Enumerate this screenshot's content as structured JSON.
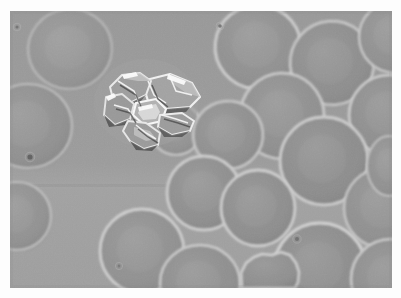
{
  "image": {
    "kind": "light-microscopy-micrograph",
    "modality": "phase-contrast",
    "subject": "red blood cells with crystal aggregate",
    "alt_text": "Phase-contrast micrograph of a blood smear showing numerous round erythrocytes on a uniform gray field with one large bright refractile polyhedral crystal aggregate in the upper left quadrant",
    "border": {
      "margin_color": "#ffffff",
      "left_px": 10,
      "top_px": 11,
      "width_px": 382,
      "height_px": 277
    },
    "palette": {
      "background_gray": "#9b9b9b",
      "background_gray_lower": "#9f9f9f",
      "cell_interior": "#8e8e8e",
      "cell_interior_dark": "#898989",
      "cell_rim_bright": "#c8c8c8",
      "cell_rim_soft": "#b4b4b4",
      "cell_shadow": "#7e7e7e",
      "crystal_highlight": "#f2f2f2",
      "crystal_midtone": "#a8a8a8",
      "crystal_shadow": "#434343",
      "artifact_dot": "#5a5a5a",
      "seam_line": "#949494"
    },
    "seam": {
      "present": true,
      "y_px": 175,
      "description": "faint horizontal tonal seam across full width"
    },
    "noise": {
      "grain_opacity": 0.16,
      "description": "fine film grain over the whole frame"
    },
    "cells": [
      {
        "name": "cell-top-left",
        "cx": 60,
        "cy": 38,
        "rx": 42,
        "ry": 40,
        "rot": -8,
        "tone": "#929292",
        "rim": "#b8b8b8",
        "rim_w": 2.2
      },
      {
        "name": "cell-top-mid-right",
        "cx": 248,
        "cy": 36,
        "rx": 43,
        "ry": 42,
        "rot": 6,
        "tone": "#8f8f8f",
        "rim": "#cfcfcf",
        "rim_w": 2.8
      },
      {
        "name": "cell-top-right",
        "cx": 322,
        "cy": 52,
        "rx": 42,
        "ry": 42,
        "rot": -4,
        "tone": "#8c8c8c",
        "rim": "#c9c9c9",
        "rim_w": 2.6
      },
      {
        "name": "cell-top-far-right",
        "cx": 385,
        "cy": 26,
        "rx": 36,
        "ry": 36,
        "rot": 0,
        "tone": "#8f8f8f",
        "rim": "#c6c6c6",
        "rim_w": 2.4
      },
      {
        "name": "cell-right-upper",
        "cx": 379,
        "cy": 104,
        "rx": 40,
        "ry": 40,
        "rot": 0,
        "tone": "#8d8d8d",
        "rim": "#cacaca",
        "rim_w": 2.6
      },
      {
        "name": "cell-mid-right-a",
        "cx": 272,
        "cy": 105,
        "rx": 42,
        "ry": 43,
        "rot": 10,
        "tone": "#8e8e8e",
        "rim": "#cbcbcb",
        "rim_w": 2.7
      },
      {
        "name": "cell-left-edge",
        "cx": 18,
        "cy": 115,
        "rx": 44,
        "ry": 42,
        "rot": 0,
        "tone": "#8f8f8f",
        "rim": "#bcbcbc",
        "rim_w": 2.2
      },
      {
        "name": "cell-crystal-adjacent",
        "cx": 166,
        "cy": 118,
        "rx": 26,
        "ry": 26,
        "rot": 0,
        "tone": "#919191",
        "rim": "#c4c4c4",
        "rim_w": 2.2
      },
      {
        "name": "cell-center-a",
        "cx": 218,
        "cy": 124,
        "rx": 35,
        "ry": 34,
        "rot": -6,
        "tone": "#8e8e8e",
        "rim": "#c8c8c8",
        "rim_w": 2.5
      },
      {
        "name": "cell-mid-right-b",
        "cx": 314,
        "cy": 150,
        "rx": 44,
        "ry": 44,
        "rot": 0,
        "tone": "#8b8b8b",
        "rim": "#cbcbcb",
        "rim_w": 2.8
      },
      {
        "name": "cell-center-b",
        "cx": 194,
        "cy": 182,
        "rx": 37,
        "ry": 37,
        "rot": 0,
        "tone": "#8d8d8d",
        "rim": "#cccccc",
        "rim_w": 2.8
      },
      {
        "name": "cell-center-c",
        "cx": 248,
        "cy": 197,
        "rx": 37,
        "ry": 38,
        "rot": 0,
        "tone": "#8c8c8c",
        "rim": "#cdcdcd",
        "rim_w": 2.8
      },
      {
        "name": "cell-left-low",
        "cx": 7,
        "cy": 205,
        "rx": 34,
        "ry": 34,
        "rot": 0,
        "tone": "#909090",
        "rim": "#bebebe",
        "rim_w": 2.2
      },
      {
        "name": "cell-right-low",
        "cx": 374,
        "cy": 197,
        "rx": 40,
        "ry": 40,
        "rot": 0,
        "tone": "#8e8e8e",
        "rim": "#c5c5c5",
        "rim_w": 2.4
      },
      {
        "name": "cell-bottom-left",
        "cx": 132,
        "cy": 240,
        "rx": 42,
        "ry": 42,
        "rot": 0,
        "tone": "#8f8f8f",
        "rim": "#cecece",
        "rim_w": 2.8
      },
      {
        "name": "cell-bottom-mid",
        "cx": 190,
        "cy": 272,
        "rx": 40,
        "ry": 38,
        "rot": 0,
        "tone": "#8d8d8d",
        "rim": "#c9c9c9",
        "rim_w": 2.6
      },
      {
        "name": "cell-bottom-right-big",
        "cx": 310,
        "cy": 258,
        "rx": 46,
        "ry": 46,
        "rot": 0,
        "tone": "#8b8b8b",
        "rim": "#d0d0d0",
        "rim_w": 3.0
      },
      {
        "name": "cell-bottom-far-right",
        "cx": 381,
        "cy": 268,
        "rx": 40,
        "ry": 40,
        "rot": 0,
        "tone": "#8d8d8d",
        "rim": "#c7c7c7",
        "rim_w": 2.6
      },
      {
        "name": "cell-right-lowest",
        "cx": 379,
        "cy": 155,
        "rx": 22,
        "ry": 30,
        "rot": 0,
        "tone": "#8f8f8f",
        "rim": "#c0c0c0",
        "rim_w": 2.0
      }
    ],
    "echinocyte": {
      "name": "crenated-cell-bottom-center",
      "cx": 262,
      "cy": 265,
      "description": "irregular crenated/notched erythrocyte with scalloped margin"
    },
    "crystal": {
      "name": "birefringent-crystal-aggregate",
      "center_x": 135,
      "center_y": 92,
      "width_px": 92,
      "height_px": 78,
      "description": "cluster of sharply faceted translucent plates with bright refractile edges and dark shadowed interfaces"
    },
    "artifacts": [
      {
        "name": "debris-dot-left",
        "cx": 20,
        "cy": 146,
        "r": 2.6,
        "color": "#5a5a5a"
      },
      {
        "name": "debris-dot-top-left",
        "cx": 7,
        "cy": 16,
        "r": 1.6,
        "color": "#6e6e6e"
      },
      {
        "name": "debris-dot-top-mid",
        "cx": 210,
        "cy": 15,
        "r": 1.8,
        "color": "#6a6a6a"
      },
      {
        "name": "debris-dot-center",
        "cx": 109,
        "cy": 255,
        "r": 1.4,
        "color": "#747474"
      },
      {
        "name": "debris-dot-right-low",
        "cx": 287,
        "cy": 228,
        "r": 2.0,
        "color": "#6b6b6b"
      }
    ]
  }
}
